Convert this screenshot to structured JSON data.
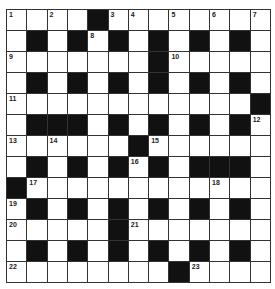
{
  "puzzle": {
    "rows": 13,
    "cols": 13,
    "layout": [
      "....#........",
      ".#.#.#.#.#.#.",
      ".......#.....",
      ".#.#.#.#.#.#.",
      "............#",
      ".###.#.#.#.#.",
      "......#......",
      ".#.#.#.#.###.",
      "#............",
      ".#.#.#.#.#.#.",
      ".....#.......",
      ".#.#.#.#.#.#.",
      "........#...."
    ],
    "numbers": {
      "0,0": "1",
      "0,2": "2",
      "0,5": "3",
      "0,6": "4",
      "0,8": "5",
      "0,10": "6",
      "0,12": "7",
      "1,4": "8",
      "2,0": "9",
      "2,8": "10",
      "4,0": "11",
      "5,12": "12",
      "6,0": "13",
      "6,2": "14",
      "6,7": "15",
      "7,6": "16",
      "8,1": "17",
      "8,10": "18",
      "9,0": "19",
      "10,0": "20",
      "10,6": "21",
      "12,0": "22",
      "12,9": "23"
    },
    "colors": {
      "block": "#111111",
      "cell": "#ffffff",
      "line": "#333333"
    }
  }
}
